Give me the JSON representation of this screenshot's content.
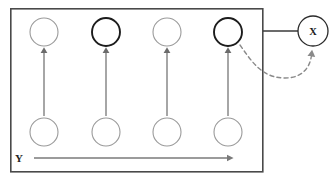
{
  "diagram": {
    "frame": {
      "name": "plate-boundary",
      "x": 10,
      "y": 8,
      "width": 253,
      "height": 164,
      "stroke": "#4a4a4a"
    },
    "top_row": {
      "label": "observed-variable-row",
      "cy": 32,
      "radius": 14,
      "nodes": [
        {
          "id": "top-1",
          "cx": 44,
          "emphasis": "light",
          "label": ""
        },
        {
          "id": "top-2",
          "cx": 106,
          "emphasis": "bold",
          "label": ""
        },
        {
          "id": "top-3",
          "cx": 167,
          "emphasis": "light",
          "label": ""
        },
        {
          "id": "top-4",
          "cx": 228,
          "emphasis": "bold",
          "label": ""
        }
      ]
    },
    "bottom_row": {
      "label": "latent-variable-row",
      "cy": 132,
      "radius": 14,
      "nodes": [
        {
          "id": "bottom-1",
          "cx": 44,
          "emphasis": "light",
          "label": ""
        },
        {
          "id": "bottom-2",
          "cx": 106,
          "emphasis": "light",
          "label": ""
        },
        {
          "id": "bottom-3",
          "cx": 167,
          "emphasis": "light",
          "label": ""
        },
        {
          "id": "bottom-4",
          "cx": 228,
          "emphasis": "light",
          "label": ""
        }
      ]
    },
    "vertical_arrows": [
      {
        "id": "arrow-1",
        "x": 44,
        "y_start": 116,
        "y_end": 50
      },
      {
        "id": "arrow-2",
        "x": 106,
        "y_start": 116,
        "y_end": 50
      },
      {
        "id": "arrow-3",
        "x": 167,
        "y_start": 116,
        "y_end": 50
      },
      {
        "id": "arrow-4",
        "x": 228,
        "y_start": 116,
        "y_end": 50
      }
    ],
    "external_node": {
      "id": "node-x",
      "label": "X",
      "cx": 313,
      "cy": 31,
      "radius": 15,
      "emphasis": "normal"
    },
    "connector_line": {
      "id": "frame-to-x-link",
      "x_start": 263,
      "x_end": 298,
      "y": 31
    },
    "dashed_feedback": {
      "id": "feedback-curve",
      "path": "M 240 45 C 252 62, 262 78, 285 78 C 301 78, 309 68, 311 56",
      "arrow_tip_x": 312,
      "arrow_tip_y": 50,
      "style": "dashed"
    },
    "axis": {
      "label": "Y",
      "label_x": 19,
      "label_y": 164,
      "line_x_start": 34,
      "line_x_end": 229,
      "line_y": 158
    },
    "colors": {
      "frame": "#4a4a4a",
      "light_node": "#9a9a9a",
      "bold_node": "#1c1c1c",
      "arrow": "#6b6b6b",
      "dashed": "#8a8a8a",
      "link": "#3a3a3a",
      "text": "#1a1a1a"
    }
  }
}
